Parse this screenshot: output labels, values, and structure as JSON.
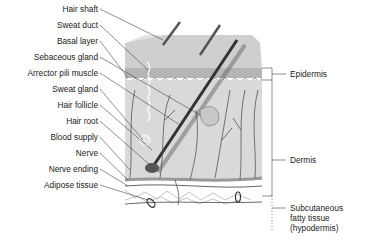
{
  "diagram": {
    "left_labels": [
      {
        "text": "Hair shaft",
        "y": 9
      },
      {
        "text": "Sweat duct",
        "y": 25
      },
      {
        "text": "Basal layer",
        "y": 41
      },
      {
        "text": "Sebaceous gland",
        "y": 57
      },
      {
        "text": "Arrector pili muscle",
        "y": 73
      },
      {
        "text": "Sweat gland",
        "y": 89
      },
      {
        "text": "Hair follicle",
        "y": 105
      },
      {
        "text": "Hair root",
        "y": 121
      },
      {
        "text": "Blood supply",
        "y": 137
      },
      {
        "text": "Nerve",
        "y": 153
      },
      {
        "text": "Nerve ending",
        "y": 169
      },
      {
        "text": "Adipose tissue",
        "y": 185
      }
    ],
    "right_labels": [
      {
        "text": "Epidermis",
        "y": 43
      },
      {
        "text": "Dermis",
        "y": 131
      },
      {
        "text": "Subcutaneous",
        "line2": "fatty tissue",
        "line3": "(hypodermis)",
        "y": 200
      }
    ],
    "colors": {
      "epidermis_top": "#cfcfcf",
      "epidermis_side": "#b8b8b8",
      "dermis": "#d6d6d6",
      "hair": "#4a4a4a",
      "lines": "#555555",
      "text": "#222222"
    }
  }
}
